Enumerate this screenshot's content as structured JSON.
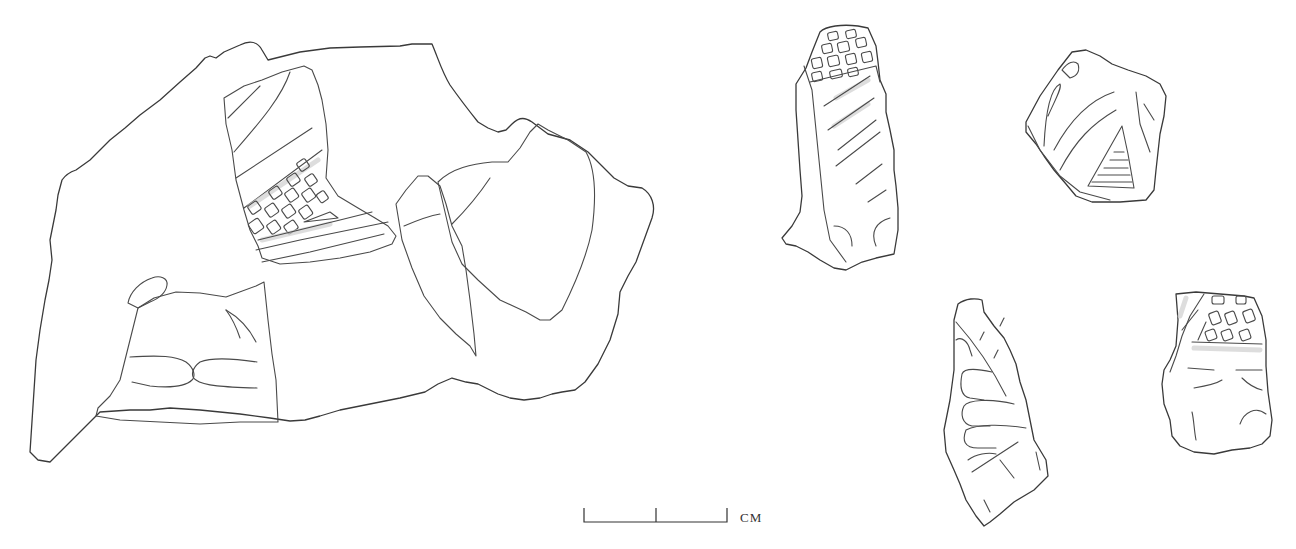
{
  "figure": {
    "type": "archaeological line drawing of pottery sherds",
    "fragment_count": 5,
    "fragments": [
      {
        "id": 1,
        "position": "left, large",
        "decoration": [
          "diagonal incised lines",
          "cross-hatched grid",
          "paired curved grooves",
          "oval lug"
        ]
      },
      {
        "id": 2,
        "position": "top center-right",
        "decoration": [
          "grid squares",
          "diagonal incised lines",
          "curved arcs at base"
        ]
      },
      {
        "id": 3,
        "position": "top right",
        "decoration": [
          "curved lines",
          "horizontal hatching in triangle"
        ]
      },
      {
        "id": 4,
        "position": "bottom center-right",
        "decoration": [
          "finger-like curved grooves",
          "diagonal line"
        ]
      },
      {
        "id": 5,
        "position": "bottom right",
        "decoration": [
          "grid squares",
          "horizontal band",
          "curved lines"
        ]
      }
    ]
  },
  "scale_bar": {
    "unit_label": "CM",
    "divisions": 2
  }
}
